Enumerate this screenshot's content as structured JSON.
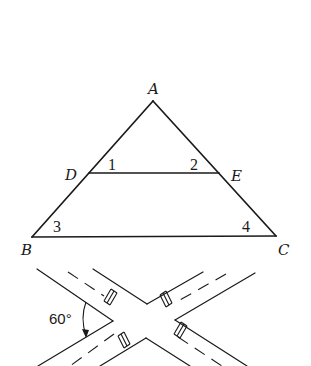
{
  "triangle_figure": {
    "vertices": {
      "A": {
        "x": 153,
        "y": 101,
        "label": "A",
        "label_x": 148,
        "label_y": 94
      },
      "B": {
        "x": 32,
        "y": 237,
        "label": "B",
        "label_x": 21,
        "label_y": 255
      },
      "C": {
        "x": 276,
        "y": 236,
        "label": "C",
        "label_x": 278,
        "label_y": 255
      },
      "D": {
        "x": 89,
        "y": 173,
        "label": "D",
        "label_x": 65,
        "label_y": 180
      },
      "E": {
        "x": 219,
        "y": 173,
        "label": "E",
        "label_x": 231,
        "label_y": 181
      }
    },
    "angle_labels": [
      {
        "text": "1",
        "x": 108,
        "y": 170
      },
      {
        "text": "2",
        "x": 190,
        "y": 170
      },
      {
        "text": "3",
        "x": 53,
        "y": 232
      },
      {
        "text": "4",
        "x": 242,
        "y": 232
      }
    ],
    "segments": [
      [
        "A",
        "B"
      ],
      [
        "A",
        "C"
      ],
      [
        "B",
        "C"
      ],
      [
        "D",
        "E"
      ]
    ]
  },
  "intersection_figure": {
    "angle_label": "60°",
    "angle_label_pos": {
      "x": 49,
      "y": 324
    },
    "road_edges": [
      [
        [
          37,
          269
        ],
        [
          113,
          321
        ]
      ],
      [
        [
          93,
          269
        ],
        [
          147,
          304
        ]
      ],
      [
        [
          147,
          304
        ],
        [
          203,
          272
        ]
      ],
      [
        [
          175,
          320
        ],
        [
          255,
          273
        ]
      ],
      [
        [
          113,
          321
        ],
        [
          38,
          366
        ]
      ],
      [
        [
          146,
          338
        ],
        [
          100,
          366
        ]
      ],
      [
        [
          146,
          338
        ],
        [
          190,
          366
        ]
      ],
      [
        [
          175,
          320
        ],
        [
          247,
          366
        ]
      ]
    ],
    "center_dashes": [
      [
        [
          68,
          272
        ],
        [
          108,
          299
        ]
      ],
      [
        [
          226,
          274
        ],
        [
          176,
          302
        ]
      ],
      [
        [
          118,
          331
        ],
        [
          70,
          366
        ]
      ],
      [
        [
          176,
          333
        ],
        [
          220,
          366
        ]
      ]
    ],
    "crosswalks": [
      {
        "x1": 103,
        "y1": 302,
        "x2": 112,
        "y2": 312
      },
      {
        "x1": 162,
        "y1": 294,
        "x2": 167,
        "y2": 308
      },
      {
        "x1": 120,
        "y1": 325,
        "x2": 128,
        "y2": 339
      },
      {
        "x1": 176,
        "y1": 324,
        "x2": 185,
        "y2": 334
      }
    ],
    "arc": {
      "start": [
        86,
        302
      ],
      "control": [
        78,
        318
      ],
      "end": [
        86,
        336
      ]
    }
  }
}
